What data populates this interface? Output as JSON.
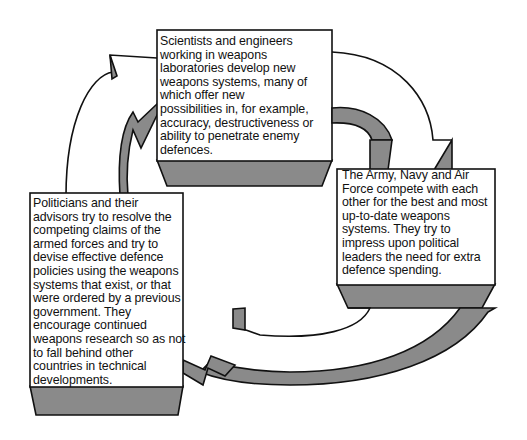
{
  "diagram": {
    "type": "cycle",
    "colors": {
      "arrow_fill": "#8a8a8a",
      "box_fill": "#ffffff",
      "stroke": "#111111",
      "background": "#ffffff"
    },
    "boxes": [
      {
        "id": "scientists",
        "text": "Scientists and engineers\nworking in weapons\nlaboratories develop new\nweapons systems, many of\nwhich offer new\npossibilities in, for example,\naccuracy, destructiveness or\nability to penetrate enemy\ndefences."
      },
      {
        "id": "armed_forces",
        "text": "   The Army, Navy and Air\nForce compete with each\nother for the best and most\nup-to-date weapons\nsystems. They try to\nimpress upon political\nleaders the need for extra\ndefence spending."
      },
      {
        "id": "politicians",
        "text": "   Politicians and their\nadvisors try to resolve the\ncompeting claims of the\narmed forces and try to\ndevise effective defence\npolicies using the weapons\nsystems that exist, or that\nwere ordered by a previous\ngovernment. They\nencourage continued\nweapons research so as not\nto fall behind other\ncountries in technical\ndevelopments."
      }
    ],
    "arrows": [
      {
        "from": "scientists",
        "to": "armed_forces"
      },
      {
        "from": "armed_forces",
        "to": "politicians"
      },
      {
        "from": "politicians",
        "to": "scientists"
      }
    ]
  }
}
